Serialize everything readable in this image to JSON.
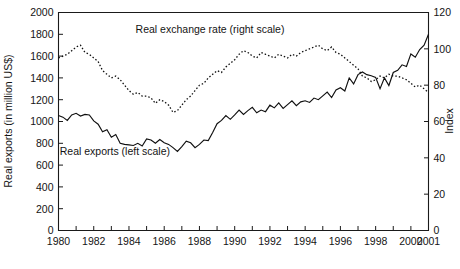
{
  "chart_data": {
    "type": "line",
    "title": "",
    "xlabel": "",
    "ylabel": "Real exports (in million US$)",
    "y2label": "Index",
    "xlim": [
      1980,
      2001
    ],
    "ylim": [
      0,
      2000
    ],
    "y2lim": [
      0,
      120
    ],
    "grid": false,
    "legend_position": "inline-annotations",
    "x_ticks": [
      1980,
      1981,
      1982,
      1983,
      1984,
      1985,
      1986,
      1987,
      1988,
      1989,
      1990,
      1991,
      1992,
      1993,
      1994,
      1995,
      1996,
      1997,
      1998,
      1999,
      2000,
      2001
    ],
    "x_tick_labels": [
      "1980",
      "",
      "1982",
      "",
      "1984",
      "",
      "1986",
      "",
      "1988",
      "",
      "1990",
      "",
      "1992",
      "",
      "1994",
      "",
      "1996",
      "",
      "1998",
      "",
      "2000",
      "2001"
    ],
    "y_ticks": [
      0,
      200,
      400,
      600,
      800,
      1000,
      1200,
      1400,
      1600,
      1800,
      2000
    ],
    "y_tick_labels": [
      "0",
      "200",
      "400",
      "600",
      "800",
      "1000",
      "1200",
      "1400",
      "1600",
      "1800",
      "2000"
    ],
    "y2_ticks": [
      0,
      20,
      40,
      60,
      80,
      100,
      120
    ],
    "y2_tick_labels": [
      "0",
      "20",
      "40",
      "60",
      "80",
      "100",
      "120"
    ],
    "annotations": [
      {
        "text": "Real exchange rate (right scale)",
        "x": 1988.6,
        "y_index": 108.5
      },
      {
        "text": "Real exports (left scale)",
        "x": 1983.2,
        "y_value": 690
      }
    ],
    "x_quarterly": [
      1980.0,
      1980.25,
      1980.5,
      1980.75,
      1981.0,
      1981.25,
      1981.5,
      1981.75,
      1982.0,
      1982.25,
      1982.5,
      1982.75,
      1983.0,
      1983.25,
      1983.5,
      1983.75,
      1984.0,
      1984.25,
      1984.5,
      1984.75,
      1985.0,
      1985.25,
      1985.5,
      1985.75,
      1986.0,
      1986.25,
      1986.5,
      1986.75,
      1987.0,
      1987.25,
      1987.5,
      1987.75,
      1988.0,
      1988.25,
      1988.5,
      1988.75,
      1989.0,
      1989.25,
      1989.5,
      1989.75,
      1990.0,
      1990.25,
      1990.5,
      1990.75,
      1991.0,
      1991.25,
      1991.5,
      1991.75,
      1992.0,
      1992.25,
      1992.5,
      1992.75,
      1993.0,
      1993.25,
      1993.5,
      1993.75,
      1994.0,
      1994.25,
      1994.5,
      1994.75,
      1995.0,
      1995.25,
      1995.5,
      1995.75,
      1996.0,
      1996.25,
      1996.5,
      1996.75,
      1997.0,
      1997.25,
      1997.5,
      1997.75,
      1998.0,
      1998.25,
      1998.5,
      1998.75,
      1999.0,
      1999.25,
      1999.5,
      1999.75,
      2000.0,
      2000.25,
      2000.5,
      2000.75,
      2001.0
    ],
    "series": [
      {
        "name": "Real exports (left scale)",
        "scale": "left",
        "style": "solid",
        "unit": "million US$",
        "values": [
          1055,
          1040,
          1010,
          1060,
          1075,
          1050,
          1065,
          1060,
          1005,
          975,
          905,
          925,
          855,
          880,
          800,
          790,
          785,
          780,
          800,
          775,
          840,
          830,
          800,
          835,
          805,
          790,
          760,
          725,
          770,
          820,
          805,
          760,
          790,
          830,
          825,
          900,
          980,
          1010,
          1055,
          1020,
          1060,
          1105,
          1065,
          1100,
          1130,
          1080,
          1105,
          1090,
          1150,
          1125,
          1170,
          1120,
          1155,
          1190,
          1145,
          1180,
          1190,
          1175,
          1215,
          1200,
          1235,
          1270,
          1220,
          1290,
          1310,
          1280,
          1400,
          1345,
          1430,
          1455,
          1430,
          1420,
          1405,
          1300,
          1400,
          1330,
          1450,
          1470,
          1520,
          1505,
          1620,
          1590,
          1660,
          1700,
          1800
        ]
      },
      {
        "name": "Real exchange rate (right scale)",
        "scale": "right",
        "style": "dotted",
        "unit": "Index",
        "values": [
          95,
          96,
          97,
          99,
          101,
          102,
          98,
          97,
          95,
          93,
          88,
          86,
          84,
          85,
          83,
          80,
          77,
          75,
          76,
          74,
          74,
          73,
          70,
          72,
          71,
          69,
          65,
          66,
          69,
          72,
          74,
          77,
          80,
          81,
          84,
          86,
          88,
          87,
          90,
          92,
          94,
          97,
          99,
          98,
          96,
          95,
          98,
          97,
          96,
          95,
          97,
          96,
          95,
          97,
          96,
          98,
          99,
          100,
          101,
          102,
          100,
          99,
          101,
          98,
          97,
          95,
          93,
          91,
          89,
          85,
          84,
          82,
          83,
          85,
          84,
          86,
          85,
          85,
          84,
          83,
          81,
          79,
          80,
          78,
          76
        ]
      }
    ]
  },
  "labels": {
    "y_axis_title": "Real exports (in million US$)",
    "y2_axis_title": "Index",
    "annotation_exchange_rate": "Real exchange rate (right scale)",
    "annotation_exports": "Real exports (left scale)"
  },
  "colors": {
    "line": "#101010",
    "axis": "#1a1a1a",
    "background": "#ffffff"
  }
}
